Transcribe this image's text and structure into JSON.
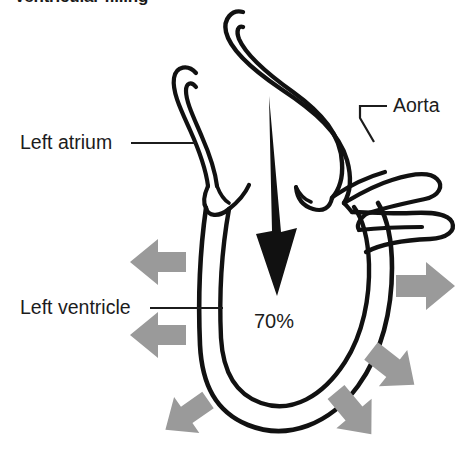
{
  "figure": {
    "title": "Ventricular filling",
    "background_color": "#ffffff",
    "outline_color": "#111111",
    "flow_arrow_color": "#111111",
    "expansion_arrow_color": "#9a9a9a",
    "text_color": "#1c1c1c"
  },
  "labels": {
    "left_atrium": "Left atrium",
    "left_ventricle": "Left ventricle",
    "aorta": "Aorta",
    "fill_percentage": "70%"
  },
  "annotations": {
    "inflow_arrow_name": "blood-inflow-arrow",
    "inflow_direction": "down",
    "expansion_arrow_count": 6,
    "expansion_directions": [
      "left",
      "left",
      "down-left",
      "right",
      "down-right",
      "down-right"
    ]
  }
}
